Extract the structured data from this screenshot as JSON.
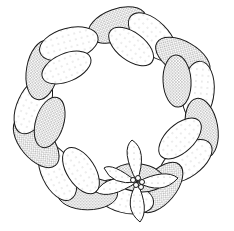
{
  "illustration": {
    "subject": "Braided bread wreath with poinsettia",
    "style": "stippled black ink line art",
    "colors": {
      "background": "#ffffff",
      "ink": "#1a1a1a",
      "stipple": "#2a2a2a"
    },
    "wreath": {
      "center_x": 117,
      "center_y": 113,
      "outer_radius": 108,
      "inner_radius": 48,
      "braid_segments": 14
    },
    "flower": {
      "type": "poinsettia",
      "center_x": 137,
      "center_y": 182,
      "bracts": 5,
      "berries": 5
    }
  }
}
